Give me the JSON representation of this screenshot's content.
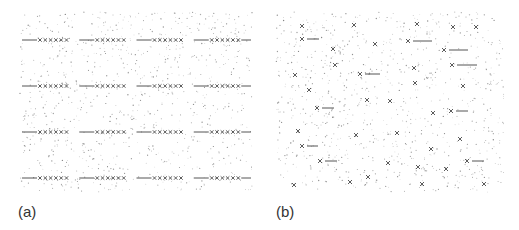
{
  "figure": {
    "width": 519,
    "height": 230,
    "colors": {
      "background": "#ffffff",
      "dots": "#9a9a9a",
      "marks": "#4a4a4a",
      "lines": "#555555",
      "label": "#333333"
    },
    "panels": [
      {
        "id": "a",
        "label": "(a)",
        "label_pos": [
          18,
          218
        ],
        "bounds": {
          "x": 20,
          "y": 12,
          "w": 232,
          "h": 180
        },
        "dot_count": 900,
        "arrangement": "ordered rows",
        "rows_y": [
          40,
          86,
          132,
          178
        ],
        "row_x_start": 22,
        "row_x_end": 251,
        "groups_per_row": 4,
        "marks_per_group": 6,
        "mark_spacing": 5.3,
        "segment_length": 15
      },
      {
        "id": "b",
        "label": "(b)",
        "label_pos": [
          276,
          218
        ],
        "bounds": {
          "x": 276,
          "y": 12,
          "w": 228,
          "h": 180
        },
        "dot_count": 900,
        "arrangement": "scattered",
        "marks": [
          [
            302,
            26
          ],
          [
            354,
            25
          ],
          [
            375,
            44
          ],
          [
            333,
            49
          ],
          [
            335,
            65
          ],
          [
            295,
            75
          ],
          [
            309,
            90
          ],
          [
            367,
            100
          ],
          [
            390,
            101
          ],
          [
            417,
            24
          ],
          [
            453,
            27
          ],
          [
            476,
            27
          ],
          [
            414,
            68
          ],
          [
            415,
            83
          ],
          [
            463,
            86
          ],
          [
            298,
            131
          ],
          [
            356,
            135
          ],
          [
            388,
            163
          ],
          [
            368,
            177
          ],
          [
            350,
            182
          ],
          [
            294,
            185
          ],
          [
            433,
            113
          ],
          [
            397,
            133
          ],
          [
            460,
            139
          ],
          [
            431,
            149
          ],
          [
            418,
            167
          ],
          [
            446,
            169
          ],
          [
            422,
            184
          ],
          [
            484,
            184
          ]
        ],
        "marks_with_segments": [
          {
            "mark": [
              302,
              39
            ],
            "seg_end": 319
          },
          {
            "mark": [
              360,
              74
            ],
            "seg_end": 380
          },
          {
            "mark": [
              317,
              108
            ],
            "seg_end": 334
          },
          {
            "mark": [
              408,
              41
            ],
            "seg_end": 432
          },
          {
            "mark": [
              444,
              50
            ],
            "seg_end": 468
          },
          {
            "mark": [
              452,
              65
            ],
            "seg_end": 477
          },
          {
            "mark": [
              302,
              146
            ],
            "seg_end": 318
          },
          {
            "mark": [
              320,
              161
            ],
            "seg_end": 337
          },
          {
            "mark": [
              451,
              111
            ],
            "seg_end": 468
          },
          {
            "mark": [
              467,
              161
            ],
            "seg_end": 484
          }
        ]
      }
    ]
  }
}
